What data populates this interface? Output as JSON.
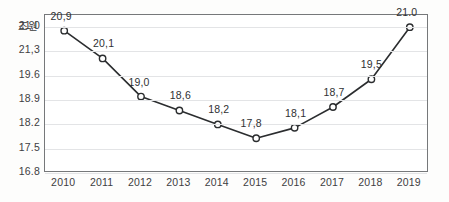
{
  "chart_data": {
    "type": "line",
    "title": "",
    "xlabel": "",
    "ylabel": "조원",
    "unit_label": "조원",
    "categories": [
      "2010",
      "2011",
      "2012",
      "2013",
      "2014",
      "2015",
      "2016",
      "2017",
      "2018",
      "2019"
    ],
    "values": [
      20.9,
      20.1,
      19.0,
      18.6,
      18.2,
      17.8,
      18.1,
      18.7,
      19.5,
      21.0
    ],
    "data_labels": [
      "20,9",
      "20,1",
      "19,0",
      "18,6",
      "18,2",
      "17,8",
      "18,1",
      "18,7",
      "19,5",
      "21.0"
    ],
    "y_tick_labels": [
      "21,0",
      "21,3",
      "19.6",
      "18.9",
      "18.2",
      "17.5",
      "16.8"
    ],
    "y_tick_values": [
      21.0,
      20.3,
      19.6,
      18.9,
      18.2,
      17.5,
      16.8
    ],
    "ylim": [
      16.8,
      21.35
    ],
    "grid": true,
    "legend": "none",
    "series": [
      {
        "name": "조원",
        "values": [
          20.9,
          20.1,
          19.0,
          18.6,
          18.2,
          17.8,
          18.1,
          18.7,
          19.5,
          21.0
        ]
      }
    ],
    "colors": {
      "line": "#2b2d2f",
      "marker_fill": "#ffffff",
      "marker_stroke": "#2b2d2f",
      "gridline": "#e3e4e6",
      "frame": "#76787a",
      "text": "#3e4042",
      "background": "#ffffff"
    }
  }
}
